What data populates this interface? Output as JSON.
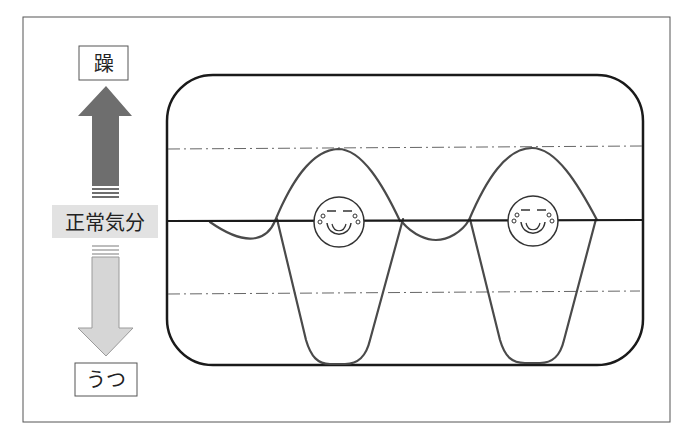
{
  "labels": {
    "mania": "躁",
    "normal_mood": "正常気分",
    "depression": "うつ"
  },
  "colors": {
    "frame": "#555555",
    "box_stroke": "#1a1a1a",
    "wave_stroke": "#4a4a4a",
    "dash_line": "#666666",
    "up_arrow": "#6e6e6e",
    "down_arrow": "#d6d6d6",
    "normal_bg": "#e2e2e2"
  },
  "arrows": {
    "up": {
      "direction": "up",
      "meaning": "toward mania"
    },
    "down": {
      "direction": "down",
      "meaning": "toward depression"
    }
  },
  "chart_area": {
    "upper_threshold_line": "dash-dot",
    "baseline": "solid",
    "lower_threshold_line": "dash-dot",
    "episodes": [
      {
        "type": "manic-depressive cycle",
        "face": "smiley"
      },
      {
        "type": "manic-depressive cycle",
        "face": "smiley"
      }
    ]
  }
}
